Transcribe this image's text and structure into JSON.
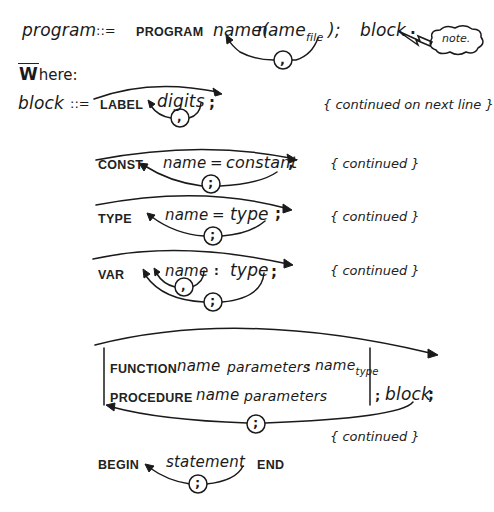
{
  "program_rule": {
    "lhs": "program",
    "def_symbol": "::=",
    "keyword": "PROGRAM",
    "name": "name",
    "open_paren": "(",
    "param": "name",
    "param_subscript": "file",
    "loop_separator": ",",
    "close_paren_semicolon": ");",
    "block": "block",
    "period": ".",
    "note_label": "note."
  },
  "where_label": "Where:",
  "where_initial": "W",
  "where_rest": "here:",
  "block_rule": {
    "lhs": "block",
    "def_symbol": "::=",
    "sections": [
      {
        "id": "label",
        "keyword": "LABEL",
        "items": [
          "digits"
        ],
        "loop_separator": ",",
        "terminator": ";",
        "comment": "{ continued on next line }"
      },
      {
        "id": "const",
        "keyword": "CONST",
        "items": [
          "name",
          "=",
          "constant"
        ],
        "loop_separator": ";",
        "terminator": ";",
        "comment": "{ continued }"
      },
      {
        "id": "type",
        "keyword": "TYPE",
        "items": [
          "name",
          "=",
          "type"
        ],
        "loop_separator": ";",
        "terminator": ";",
        "comment": "{ continued }"
      },
      {
        "id": "var",
        "keyword": "VAR",
        "items": [
          "name",
          ":",
          "type"
        ],
        "inner_loop_separator": ",",
        "loop_separator": ";",
        "terminator": ";",
        "comment": "{ continued }"
      },
      {
        "id": "subprograms",
        "function_keyword": "FUNCTION",
        "function_name": "name",
        "function_params": "parameters",
        "function_colon": ":",
        "function_type": "name",
        "function_type_subscript": "type",
        "procedure_keyword": "PROCEDURE",
        "procedure_name": "name",
        "procedure_params": "parameters",
        "after_bar": "; block",
        "after_bar_semicolon": "; ",
        "after_bar_block": "block",
        "terminator": ";",
        "loop_separator": ";",
        "comment": "{ continued }"
      },
      {
        "id": "body",
        "keyword": "BEGIN",
        "items": [
          "statement"
        ],
        "loop_separator": ";",
        "end_keyword": "END"
      }
    ]
  }
}
